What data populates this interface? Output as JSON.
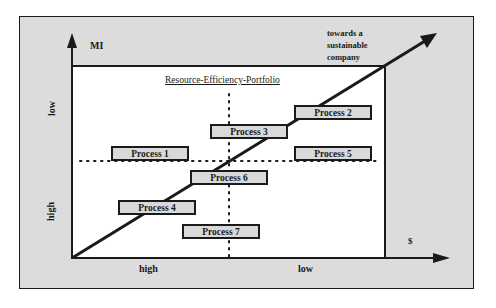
{
  "diagram": {
    "title": "Resource-Efficiency-Portfolio",
    "y_axis": {
      "label": "MI",
      "top_label": "low",
      "bottom_label": "high"
    },
    "x_axis": {
      "label": "$",
      "left_label": "high",
      "right_label": "low"
    },
    "trend_label": {
      "line1": "towards a",
      "line2": "sustainable",
      "line3": "company"
    },
    "processes": [
      {
        "id": "p1",
        "label": "Process 1"
      },
      {
        "id": "p2",
        "label": "Process 2"
      },
      {
        "id": "p3",
        "label": "Process 3"
      },
      {
        "id": "p4",
        "label": "Process 4"
      },
      {
        "id": "p5",
        "label": "Process 5"
      },
      {
        "id": "p6",
        "label": "Process 6"
      },
      {
        "id": "p7",
        "label": "Process 7"
      }
    ],
    "colors": {
      "frame_fill": "#dcdcdc",
      "plot_fill": "#ffffff",
      "box_fill": "#d9d9d9",
      "stroke": "#1a1a1a"
    }
  }
}
